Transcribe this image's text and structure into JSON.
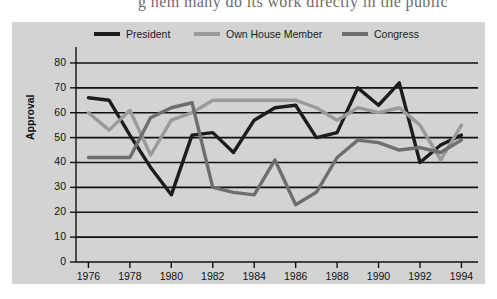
{
  "caption": {
    "text": "g  hem many do its work directly in the public"
  },
  "figure": {
    "background_color": "#d3d3d3",
    "plot_background_color": "#d3d3d3"
  },
  "chart_data": {
    "type": "line",
    "title": "",
    "xlabel": "",
    "ylabel": "Approval",
    "x": [
      1976,
      1977,
      1978,
      1979,
      1980,
      1981,
      1982,
      1983,
      1984,
      1985,
      1986,
      1987,
      1988,
      1989,
      1990,
      1991,
      1992,
      1993,
      1994
    ],
    "xlim": [
      1975.4,
      1994.8
    ],
    "ylim": [
      0,
      84
    ],
    "yticks": [
      0,
      10,
      20,
      30,
      40,
      50,
      60,
      70,
      80
    ],
    "xticks": [
      1976,
      1978,
      1980,
      1982,
      1984,
      1986,
      1988,
      1990,
      1992,
      1994
    ],
    "grid": true,
    "grid_axis": "y",
    "legend_position": "top",
    "series": [
      {
        "name": "President",
        "color": "#1c1c1c",
        "values": [
          66,
          65,
          51,
          38,
          27,
          51,
          52,
          44,
          57,
          62,
          63,
          50,
          52,
          70,
          63,
          72,
          40,
          47,
          51
        ]
      },
      {
        "name": "Own House Member",
        "color": "#9a9a9a",
        "values": [
          60,
          53,
          61,
          43,
          57,
          60,
          65,
          65,
          65,
          65,
          65,
          62,
          57,
          62,
          60,
          62,
          55,
          41,
          55
        ]
      },
      {
        "name": "Congress",
        "color": "#6e6e6e",
        "values": [
          42,
          42,
          42,
          58,
          62,
          64,
          30,
          28,
          27,
          41,
          23,
          28,
          42,
          49,
          48,
          45,
          46,
          44,
          49
        ]
      }
    ],
    "series_congress_note": "gray mid-tone line"
  },
  "legend": {
    "items": [
      {
        "label": "President",
        "color": "#1c1c1c",
        "x": 82
      },
      {
        "label": "Own House Member",
        "color": "#9a9a9a",
        "x": 182
      },
      {
        "label": "Congress",
        "color": "#6e6e6e",
        "x": 330
      }
    ]
  }
}
